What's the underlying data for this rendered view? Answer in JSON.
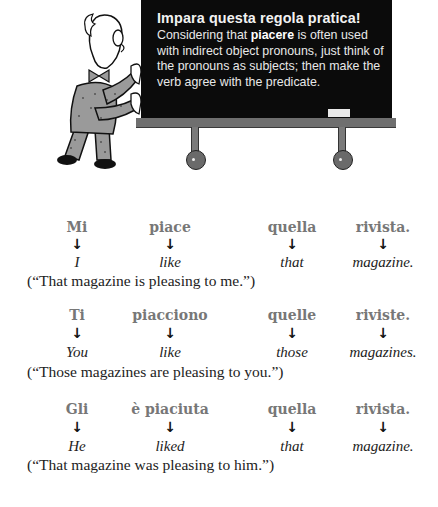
{
  "illustration": {
    "figure": "professor pushing chalkboard",
    "chalkboard": {
      "title": "Impara questa regola pratica!",
      "body_before": "Considering that ",
      "body_bold": "piacere",
      "body_after": " is often used with indirect object pronouns, just think of the pronouns as subjects; then make the verb agree with the predicate."
    }
  },
  "colors": {
    "board": "#0b0b0b",
    "ledge": "#6f6f6f",
    "italian_text": "#777777",
    "english_text": "#222222"
  },
  "examples": [
    {
      "italian": [
        "Mi",
        "piace",
        "quella",
        "rivista."
      ],
      "arrows": [
        "↓",
        "↓",
        "↓",
        "↓"
      ],
      "english": [
        "I",
        "like",
        "that",
        "magazine."
      ],
      "translation": "(“That magazine is pleasing to me.”)"
    },
    {
      "italian": [
        "Ti",
        "piacciono",
        "quelle",
        "riviste."
      ],
      "arrows": [
        "↓",
        "↓",
        "↓",
        "↓"
      ],
      "english": [
        "You",
        "like",
        "those",
        "magazines."
      ],
      "translation": "(“Those magazines are pleasing to you.”)"
    },
    {
      "italian": [
        "Gli",
        "è piaciuta",
        "quella",
        "rivista."
      ],
      "arrows": [
        "↓",
        "↓",
        "↓",
        "↓"
      ],
      "english": [
        "He",
        "liked",
        "that",
        "magazine."
      ],
      "translation": "(“That magazine was pleasing to him.”)"
    }
  ]
}
